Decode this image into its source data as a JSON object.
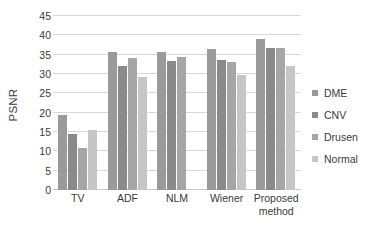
{
  "chart_data": {
    "type": "bar",
    "title": "",
    "xlabel": "",
    "ylabel": "PSNR",
    "ylim": [
      0,
      45
    ],
    "yticks": [
      0,
      5,
      10,
      15,
      20,
      25,
      30,
      35,
      40,
      45
    ],
    "grid": true,
    "legend_position": "right",
    "categories": [
      "TV",
      "ADF",
      "NLM",
      "Wiener",
      "Proposed method"
    ],
    "category_lines": [
      [
        "TV"
      ],
      [
        "ADF"
      ],
      [
        "NLM"
      ],
      [
        "Wiener"
      ],
      [
        "Proposed",
        "method"
      ]
    ],
    "series": [
      {
        "name": "DME",
        "color": "#9a9a9a",
        "values": [
          19.3,
          35.6,
          35.6,
          36.4,
          39.1
        ]
      },
      {
        "name": "CNV",
        "color": "#8a8a8a",
        "values": [
          14.5,
          32.2,
          33.3,
          33.7,
          36.6
        ]
      },
      {
        "name": "Drusen",
        "color": "#a6a6a6",
        "values": [
          10.8,
          34.1,
          34.4,
          33.2,
          36.8
        ]
      },
      {
        "name": "Normal",
        "color": "#c6c6c6",
        "values": [
          15.4,
          29.2,
          null,
          29.7,
          32.2
        ]
      }
    ]
  },
  "colors": {
    "grid": "#d8d8d8",
    "axis_text": "#3a3a3a",
    "background": "#ffffff"
  }
}
